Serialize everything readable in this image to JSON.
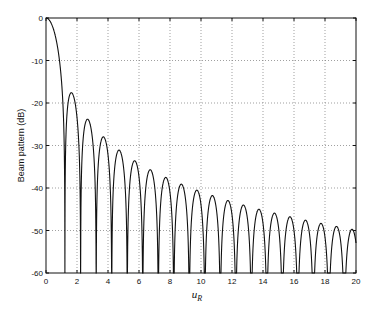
{
  "chart_data": {
    "type": "line",
    "title": "",
    "xlabel": "u",
    "xlabel_subscript": "R",
    "ylabel": "Beam pattern (dB)",
    "xlim": [
      0,
      20
    ],
    "ylim": [
      -60,
      0
    ],
    "xticks": [
      0,
      2,
      4,
      6,
      8,
      10,
      12,
      14,
      16,
      18,
      20
    ],
    "yticks": [
      0,
      -10,
      -20,
      -30,
      -40,
      -50,
      -60
    ],
    "grid": true,
    "grid_style": "dotted",
    "legend": null,
    "series": [
      {
        "name": "Beam pattern",
        "formula": "20*log10(|2*J1(pi*u)/(pi*u)|)",
        "nulls_u": [
          1.22,
          2.23,
          3.24,
          4.24,
          5.24,
          6.24,
          7.24,
          8.24,
          9.24,
          10.24,
          11.24,
          12.24,
          13.24,
          14.24,
          15.24,
          16.24,
          17.24,
          18.24,
          19.24
        ],
        "sidelobe_peaks": [
          {
            "u": 1.64,
            "db": -17.6
          },
          {
            "u": 2.68,
            "db": -23.8
          },
          {
            "u": 3.7,
            "db": -28.0
          },
          {
            "u": 4.71,
            "db": -31.1
          },
          {
            "u": 5.72,
            "db": -33.6
          },
          {
            "u": 6.72,
            "db": -35.7
          },
          {
            "u": 7.73,
            "db": -37.5
          },
          {
            "u": 8.73,
            "db": -39.0
          },
          {
            "u": 9.73,
            "db": -40.4
          },
          {
            "u": 10.73,
            "db": -41.7
          },
          {
            "u": 11.74,
            "db": -42.8
          },
          {
            "u": 12.74,
            "db": -43.9
          },
          {
            "u": 13.74,
            "db": -44.8
          },
          {
            "u": 14.74,
            "db": -45.7
          },
          {
            "u": 15.74,
            "db": -46.5
          },
          {
            "u": 16.74,
            "db": -47.3
          },
          {
            "u": 17.74,
            "db": -48.0
          },
          {
            "u": 18.74,
            "db": -48.7
          },
          {
            "u": 19.74,
            "db": -49.4
          }
        ]
      }
    ]
  },
  "plot": {
    "left": 46,
    "top": 18,
    "right": 356,
    "bottom": 273
  }
}
